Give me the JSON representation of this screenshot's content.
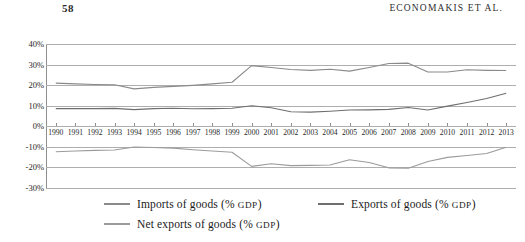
{
  "page": {
    "folio": "58",
    "running_head": "ECONOMAKIS ET AL."
  },
  "chart_data": {
    "type": "line",
    "title": "",
    "xlabel": "",
    "ylabel": "",
    "ylim": [
      -30,
      40
    ],
    "ytick_labels": [
      "40%",
      "30%",
      "20%",
      "10%",
      "0%",
      "-10%",
      "-20%",
      "-30%"
    ],
    "yticks": [
      40,
      30,
      20,
      10,
      0,
      -10,
      -20,
      -30
    ],
    "grid": true,
    "legend_position": "bottom",
    "categories": [
      "1990",
      "1991",
      "1992",
      "1993",
      "1994",
      "1995",
      "1996",
      "1997",
      "1998",
      "1999",
      "2000",
      "2001",
      "2002",
      "2003",
      "2004",
      "2005",
      "2006",
      "2007",
      "2008",
      "2009",
      "2010",
      "2011",
      "2012",
      "2013"
    ],
    "series": [
      {
        "name": "Imports of goods (% GDP)",
        "color": "#8a8a8a",
        "values": [
          21.0,
          20.6,
          20.3,
          20.2,
          18.2,
          18.9,
          19.4,
          19.9,
          20.6,
          21.4,
          29.5,
          28.6,
          27.6,
          27.2,
          27.7,
          26.8,
          28.6,
          30.5,
          30.7,
          26.4,
          26.4,
          27.5,
          27.2,
          27.1
        ]
      },
      {
        "name": "Exports of goods (% GDP)",
        "color": "#6e6e6e",
        "values": [
          8.6,
          8.6,
          8.6,
          8.7,
          8.1,
          8.6,
          8.8,
          8.5,
          8.6,
          8.8,
          10.0,
          9.0,
          7.1,
          6.9,
          7.3,
          7.9,
          8.0,
          8.2,
          9.1,
          7.9,
          9.8,
          11.6,
          13.5,
          16.1
        ]
      },
      {
        "name": "Net exports of goods (% GDP)",
        "color": "#9b9b9b",
        "values": [
          -12.4,
          -12.0,
          -11.7,
          -11.5,
          -10.1,
          -10.3,
          -10.6,
          -11.4,
          -12.0,
          -12.6,
          -19.5,
          -18.2,
          -19.1,
          -19.0,
          -18.8,
          -16.3,
          -17.6,
          -20.2,
          -20.4,
          -17.1,
          -15.1,
          -14.2,
          -13.2,
          -10.2
        ]
      }
    ]
  },
  "legend": {
    "items": [
      {
        "label": "Imports of goods (% ",
        "small_caps": "GDP",
        "suffix": ")",
        "color": "#8a8a8a"
      },
      {
        "label": "Exports of goods (% ",
        "small_caps": "GDP",
        "suffix": ")",
        "color": "#6e6e6e"
      },
      {
        "label": "Net exports of goods (% ",
        "small_caps": "GDP",
        "suffix": ")",
        "color": "#9b9b9b"
      }
    ]
  }
}
